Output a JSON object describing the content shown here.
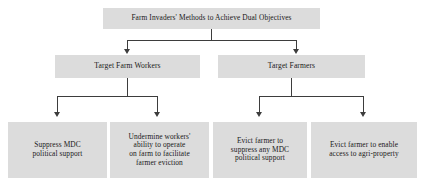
{
  "diagram": {
    "type": "hierarchy-flowchart",
    "box_fill": "#dcdcdc",
    "connector_color": "#3d3d3d",
    "background": "#ffffff",
    "root": {
      "label": "Farm Invaders' Methods to Achieve Dual Objectives"
    },
    "level2": [
      {
        "label": "Target Farm Workers"
      },
      {
        "label": "Target Farmers"
      }
    ],
    "level3": [
      {
        "lines": [
          "Suppress MDC",
          "political support"
        ]
      },
      {
        "lines": [
          "Undermine workers'",
          "ability to operate",
          "on farm to facilitate",
          "farmer eviction"
        ]
      },
      {
        "lines": [
          "Evict farmer to",
          "suppress any MDC",
          "political support"
        ]
      },
      {
        "lines": [
          "Evict farmer to enable",
          "access to agri-property"
        ]
      }
    ]
  }
}
